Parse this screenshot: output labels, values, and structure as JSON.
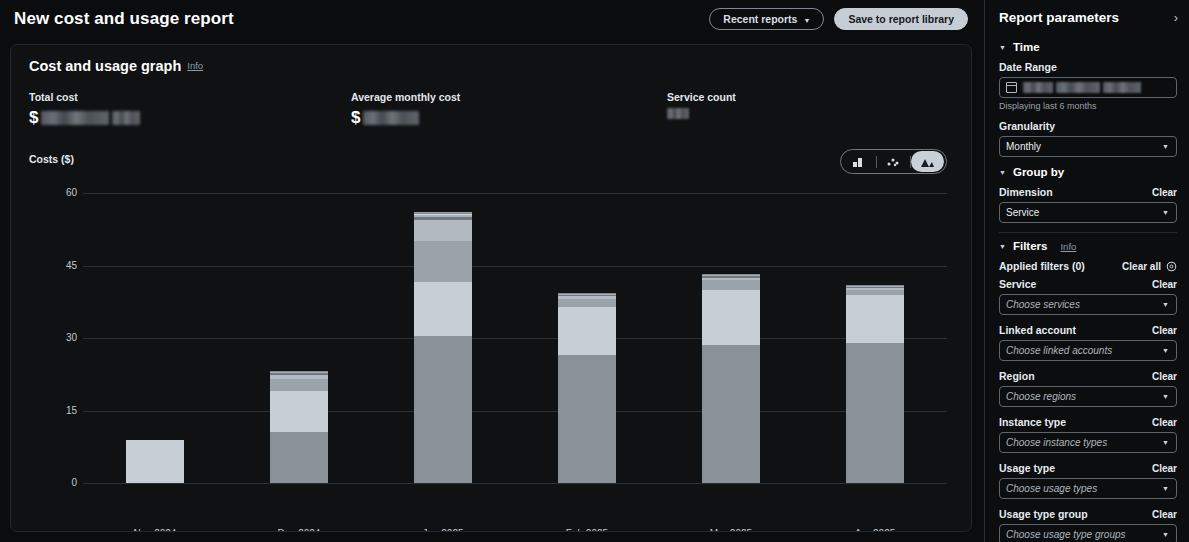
{
  "header": {
    "title": "New cost and usage report",
    "recent_reports_label": "Recent reports",
    "save_label": "Save to report library"
  },
  "card": {
    "title": "Cost and usage graph",
    "info_label": "Info",
    "stats": [
      {
        "label": "Total cost",
        "currency": "$",
        "value": "",
        "redacted": true
      },
      {
        "label": "Average monthly cost",
        "currency": "$",
        "value": "",
        "redacted": true
      },
      {
        "label": "Service count",
        "currency": "",
        "value": "",
        "redacted": true
      }
    ],
    "chart_types": [
      {
        "name": "bar-chart-icon",
        "selected": false
      },
      {
        "name": "scatter-chart-icon",
        "selected": false
      },
      {
        "name": "stacked-area-chart-icon",
        "selected": true
      }
    ]
  },
  "chart_data": {
    "type": "bar",
    "stacked": true,
    "title": "",
    "xlabel": "",
    "ylabel": "Costs ($)",
    "ylim": [
      0,
      60
    ],
    "yticks": [
      0,
      15,
      30,
      45,
      60
    ],
    "grid": true,
    "legend_position": "bottom",
    "categories": [
      "Nov 2024",
      "Dec 2024",
      "Jan 2025",
      "Feb 2025",
      "Mar 2025",
      "Apr 2025"
    ],
    "series": [
      {
        "name": "Kinesis",
        "color": "#8a9199",
        "values": [
          0,
          10.5,
          30.5,
          26.5,
          28.5,
          29.0
        ]
      },
      {
        "name": "EC2-Other",
        "color": "#c7ced5",
        "values": [
          9.0,
          8.5,
          11.0,
          10.0,
          11.5,
          10.0
        ]
      },
      {
        "name": "EC2-Instances",
        "color": "#9aa2aa",
        "values": [
          0,
          2.5,
          8.5,
          1.5,
          2.0,
          1.0
        ]
      },
      {
        "name": "Tax",
        "color": "#b3bac1",
        "values": [
          0,
          0.8,
          4.5,
          0.6,
          0.5,
          0.4
        ]
      },
      {
        "name": "VPC",
        "color": "#70777e",
        "values": [
          0,
          0.4,
          0.6,
          0.3,
          0.3,
          0.2
        ]
      },
      {
        "name": "CloudWatch",
        "color": "#a8b0b8",
        "values": [
          0,
          0.2,
          0.4,
          0.2,
          0.2,
          0.1
        ]
      },
      {
        "name": "Route 53",
        "color": "#d3d9de",
        "values": [
          0,
          0.1,
          0.2,
          0.1,
          0.1,
          0.1
        ]
      },
      {
        "name": "S3",
        "color": "#7f868d",
        "values": [
          0,
          0.1,
          0.1,
          0.1,
          0.1,
          0.1
        ]
      },
      {
        "name": "Amplify",
        "color": "#bfc6cc",
        "values": [
          0,
          0.05,
          0.1,
          0.05,
          0.05,
          0.05
        ]
      },
      {
        "name": "Others",
        "color": "#959da5",
        "values": [
          0,
          0.05,
          0.1,
          0.05,
          0.05,
          0.05
        ]
      }
    ],
    "totals": [
      9.0,
      23.2,
      56.0,
      39.4,
      43.3,
      41.0
    ]
  },
  "panel": {
    "title": "Report parameters",
    "collapse_icon": "chevron-right-icon",
    "time": {
      "section_label": "Time",
      "date_range_label": "Date Range",
      "date_range_value": "",
      "date_range_redacted": true,
      "helper": "Displaying last 6 months",
      "granularity_label": "Granularity",
      "granularity_value": "Monthly"
    },
    "group_by": {
      "section_label": "Group by",
      "dimension_label": "Dimension",
      "dimension_clear": "Clear",
      "dimension_value": "Service"
    },
    "filters": {
      "section_label": "Filters",
      "info_label": "Info",
      "applied_label": "Applied filters (0)",
      "clear_all_label": "Clear all",
      "gear_icon": "settings-gear-icon",
      "items": [
        {
          "label": "Service",
          "clear": "Clear",
          "placeholder": "Choose services"
        },
        {
          "label": "Linked account",
          "clear": "Clear",
          "placeholder": "Choose linked accounts"
        },
        {
          "label": "Region",
          "clear": "Clear",
          "placeholder": "Choose regions"
        },
        {
          "label": "Instance type",
          "clear": "Clear",
          "placeholder": "Choose instance types"
        },
        {
          "label": "Usage type",
          "clear": "Clear",
          "placeholder": "Choose usage types"
        },
        {
          "label": "Usage type group",
          "clear": "Clear",
          "placeholder": "Choose usage type groups"
        }
      ]
    }
  }
}
